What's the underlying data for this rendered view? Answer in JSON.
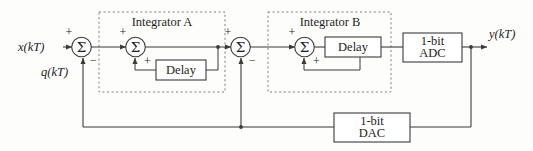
{
  "figure": {
    "type": "block-diagram",
    "background_color": "#fdfdfb",
    "line_color": "#3b3b3b",
    "dashed_group_color": "#6d6d6d"
  },
  "signals": {
    "input_label": "x(kT)",
    "quantization_label": "q(kT)",
    "output_label": "y(kT)"
  },
  "groups": [
    {
      "id": "integrator-a",
      "label": "Integrator A"
    },
    {
      "id": "integrator-b",
      "label": "Integrator B"
    }
  ],
  "blocks": {
    "delay_a": {
      "label": "Delay"
    },
    "delay_b": {
      "label": "Delay"
    },
    "adc": {
      "line1": "1-bit",
      "line2": "ADC"
    },
    "dac": {
      "line1": "1-bit",
      "line2": "DAC"
    }
  },
  "summers": [
    {
      "id": "summer-1",
      "glyph": "Σ",
      "sign_top": "+",
      "sign_bottom": "−"
    },
    {
      "id": "summer-2",
      "glyph": "Σ",
      "sign_top": "+",
      "sign_bottom": "+"
    },
    {
      "id": "summer-3",
      "glyph": "Σ",
      "sign_top": "+",
      "sign_bottom": "−"
    },
    {
      "id": "summer-4",
      "glyph": "Σ",
      "sign_top": "+",
      "sign_bottom": "+"
    }
  ]
}
